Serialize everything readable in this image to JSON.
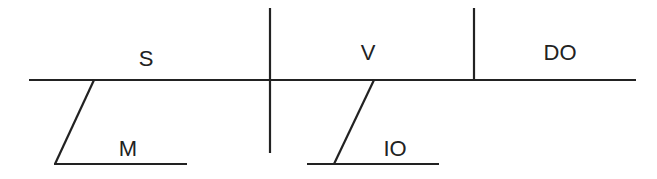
{
  "diagram": {
    "type": "sentence-diagram",
    "labels": {
      "subject": "S",
      "verb": "V",
      "direct_object": "DO",
      "modifier": "M",
      "indirect_object": "IO"
    },
    "colors": {
      "line": "#222222",
      "background": "#ffffff"
    }
  }
}
